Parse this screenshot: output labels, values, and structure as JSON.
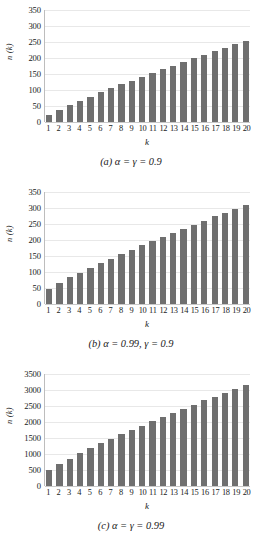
{
  "figure": {
    "bar_color": "#6f6f6f",
    "grid_color": "#e8e8e8",
    "axis_color": "#bdbdbd"
  },
  "chart_data": [
    {
      "type": "bar",
      "panel": "a",
      "caption": "(a) α = γ = 0.9",
      "title": "",
      "xlabel": "k",
      "ylabel": "n (k)",
      "categories": [
        "1",
        "2",
        "3",
        "4",
        "5",
        "6",
        "7",
        "8",
        "9",
        "10",
        "11",
        "12",
        "13",
        "14",
        "15",
        "16",
        "17",
        "18",
        "19",
        "20"
      ],
      "values": [
        22,
        39,
        52,
        65,
        79,
        94,
        107,
        118,
        129,
        141,
        152,
        166,
        176,
        188,
        199,
        209,
        222,
        231,
        244,
        253
      ],
      "yticks": [
        0,
        50,
        100,
        150,
        200,
        250,
        300,
        350
      ],
      "ylim": [
        0,
        350
      ],
      "grid": true,
      "legend": "none"
    },
    {
      "type": "bar",
      "panel": "b",
      "caption": "(b) α = 0.99,  γ = 0.9",
      "title": "",
      "xlabel": "k",
      "ylabel": "n (k)",
      "categories": [
        "1",
        "2",
        "3",
        "4",
        "5",
        "6",
        "7",
        "8",
        "9",
        "10",
        "11",
        "12",
        "13",
        "14",
        "15",
        "16",
        "17",
        "18",
        "19",
        "20"
      ],
      "values": [
        46,
        66,
        83,
        97,
        114,
        127,
        142,
        156,
        168,
        183,
        198,
        210,
        222,
        235,
        247,
        260,
        274,
        284,
        298,
        310
      ],
      "yticks": [
        0,
        50,
        100,
        150,
        200,
        250,
        300,
        350
      ],
      "ylim": [
        0,
        350
      ],
      "grid": true,
      "legend": "none"
    },
    {
      "type": "bar",
      "panel": "c",
      "caption": "(c) α = γ = 0.99",
      "title": "",
      "xlabel": "k",
      "ylabel": "n (k)",
      "categories": [
        "1",
        "2",
        "3",
        "4",
        "5",
        "6",
        "7",
        "8",
        "9",
        "10",
        "11",
        "12",
        "13",
        "14",
        "15",
        "16",
        "17",
        "18",
        "19",
        "20"
      ],
      "values": [
        490,
        690,
        850,
        1020,
        1180,
        1340,
        1460,
        1610,
        1750,
        1880,
        2020,
        2150,
        2280,
        2410,
        2540,
        2680,
        2790,
        2910,
        3030,
        3150
      ],
      "yticks": [
        0,
        500,
        1000,
        1500,
        2000,
        2500,
        3000,
        3500
      ],
      "ylim": [
        0,
        3500
      ],
      "grid": true,
      "legend": "none"
    }
  ]
}
